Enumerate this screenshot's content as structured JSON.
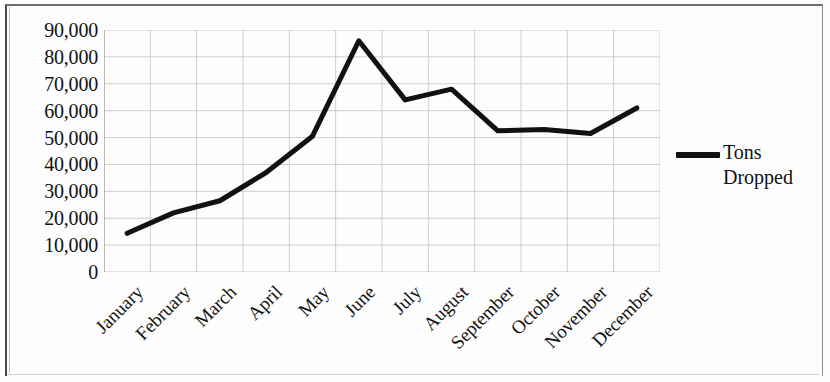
{
  "chart_data": {
    "type": "line",
    "title": "",
    "subtitle": "",
    "xlabel": "",
    "ylabel": "",
    "categories": [
      "January",
      "February",
      "March",
      "April",
      "May",
      "June",
      "July",
      "August",
      "September",
      "October",
      "November",
      "December"
    ],
    "series": [
      {
        "name": "Tons Dropped",
        "values": [
          14400,
          22000,
          26500,
          37000,
          50500,
          86000,
          64000,
          68000,
          52500,
          53000,
          51500,
          61000
        ],
        "color": "#111111"
      }
    ],
    "ylim": [
      0,
      90000
    ],
    "y_ticks": [
      0,
      10000,
      20000,
      30000,
      40000,
      50000,
      60000,
      70000,
      80000,
      90000
    ],
    "y_tick_labels": [
      "0",
      "10,000",
      "20,000",
      "30,000",
      "40,000",
      "50,000",
      "60,000",
      "70,000",
      "80,000",
      "90,000"
    ],
    "grid": {
      "horizontal": true,
      "vertical": true,
      "color": "#c8c8c8"
    },
    "legend": {
      "position": "right",
      "entries": [
        {
          "label_lines": [
            "Tons",
            "Dropped"
          ],
          "label": "Tons Dropped",
          "marker": "line",
          "color": "#111111"
        }
      ]
    },
    "x_label_rotation": -45,
    "line_width": 5,
    "plot_background": "#ffffff"
  },
  "axes": {
    "y_labels": [
      "90,000",
      "80,000",
      "70,000",
      "60,000",
      "50,000",
      "40,000",
      "30,000",
      "20,000",
      "10,000",
      "0"
    ],
    "x_labels": [
      "January",
      "February",
      "March",
      "April",
      "May",
      "June",
      "July",
      "August",
      "September",
      "October",
      "November",
      "December"
    ]
  },
  "legend": {
    "line1": "Tons",
    "line2": "Dropped"
  }
}
